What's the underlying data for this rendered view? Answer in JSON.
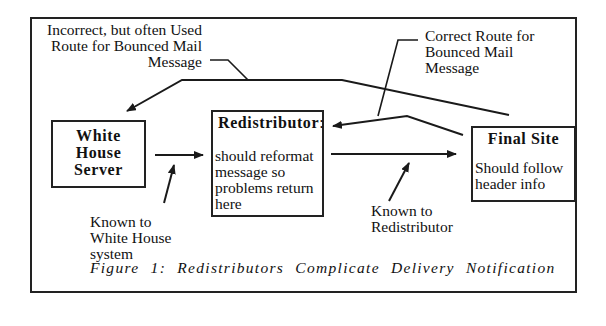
{
  "figure": {
    "caption": "Figure 1: Redistributors Complicate Delivery Notification"
  },
  "nodes": {
    "white_house": {
      "title_lines": [
        "White",
        "House",
        "Server"
      ]
    },
    "redistributor": {
      "title": "Redistributor",
      "title_suffix": ":",
      "body_lines": [
        "should reformat",
        "message so",
        "problems return",
        "here"
      ]
    },
    "final_site": {
      "title": "Final Site",
      "body_lines": [
        "Should follow",
        "header info"
      ]
    }
  },
  "annotations": {
    "incorrect_route": [
      "Incorrect, but often Used",
      "Route for Bounced Mail",
      "Message"
    ],
    "correct_route": [
      "Correct Route for",
      "Bounced Mail",
      "Message"
    ],
    "known_to_white_house": [
      "Known to",
      "White House",
      "system"
    ],
    "known_to_redistributor": [
      "Known to",
      "Redistributor"
    ]
  },
  "colors": {
    "line": "#1a1a1a",
    "background": "#ffffff"
  }
}
